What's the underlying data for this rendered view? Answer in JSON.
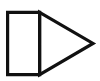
{
  "image": {
    "title": "Play Button Outline Shape",
    "description": "Black outlined rectangle with a right-pointing triangle attached to its right edge",
    "width": 100,
    "height": 81,
    "background_color": "#ffffff",
    "stroke_color": "#111111",
    "fill_color": "#ffffff",
    "stroke_width": 3.2
  },
  "shapes": {
    "rectangle": {
      "name": "rectangle",
      "left": 7.6,
      "top": 12.4,
      "right": 39.6,
      "bottom": 74.6,
      "points": "7.6,12.4 39.6,12.4 39.6,74.6 7.6,74.6"
    },
    "triangle": {
      "name": "right-pointing-triangle",
      "apex_x": 93,
      "apex_y": 43.4,
      "base_top_x": 39.6,
      "base_top_y": 12.4,
      "base_bottom_x": 39.6,
      "base_bottom_y": 74.6,
      "points": "39.6,12.4 93,43.4 39.6,74.6"
    }
  }
}
